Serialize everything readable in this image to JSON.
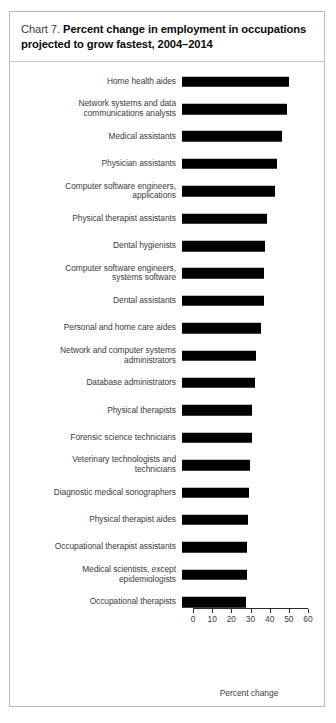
{
  "card": {
    "chart_label": "Chart 7.",
    "title": "Percent change in employment in occupations projected to grow fastest, 2004–2014"
  },
  "axis": {
    "title": "Percent change",
    "ticks": [
      "0",
      "10",
      "20",
      "30",
      "40",
      "50",
      "60"
    ]
  },
  "chart_data": {
    "type": "bar",
    "orientation": "horizontal",
    "title": "Chart 7. Percent change in employment in occupations projected to grow fastest, 2004–2014",
    "xlabel": "Percent change",
    "ylabel": "",
    "xlim": [
      0,
      60
    ],
    "grid": false,
    "legend": "none",
    "bar_color": "#000000",
    "categories": [
      "Home health aides",
      "Network systems and data\ncommunications analysts",
      "Medical assistants",
      "Physician assistants",
      "Computer software engineers,\napplications",
      "Physical therapist assistants",
      "Dental hygienists",
      "Computer software engineers,\nsystems software",
      "Dental assistants",
      "Personal and home care aides",
      "Network and computer systems\nadministrators",
      "Database administrators",
      "Physical therapists",
      "Forensic science technicians",
      "Veterinary technologists and\ntechnicians",
      "Diagnostic medical sonographers",
      "Physical therapist aides",
      "Occupational therapist assistants",
      "Medical scientists, except\nepidemiologists",
      "Occupational therapists"
    ],
    "values": [
      56.0,
      54.6,
      52.1,
      49.6,
      48.4,
      44.2,
      43.3,
      43.0,
      42.7,
      41.0,
      38.4,
      38.2,
      36.7,
      36.4,
      35.3,
      34.8,
      34.4,
      34.1,
      34.1,
      33.6
    ]
  }
}
